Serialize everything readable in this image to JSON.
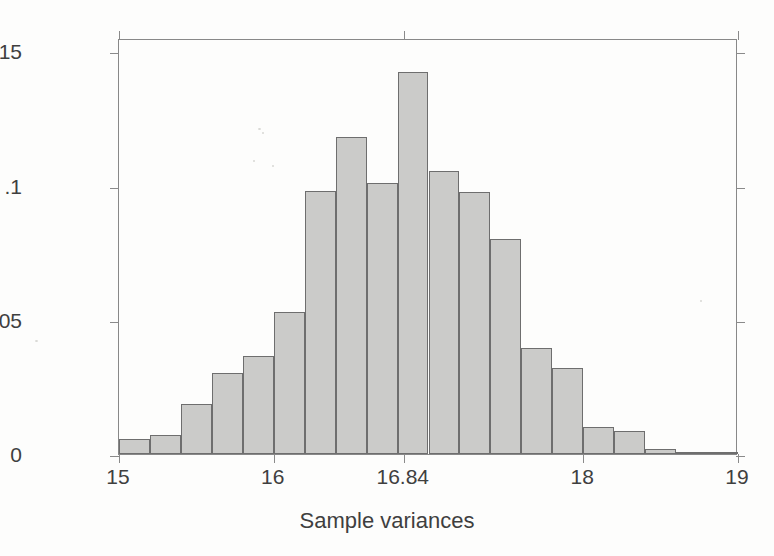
{
  "figure": {
    "background_color": "#fdfdfc",
    "frame_color": "#888888"
  },
  "chart_data": {
    "type": "bar",
    "subtype": "histogram",
    "title": "",
    "xlabel": "Sample variances",
    "ylabel": "Fraction",
    "xlim": [
      15,
      19
    ],
    "ylim": [
      0,
      0.155
    ],
    "grid": false,
    "legend": null,
    "bar_color": "#cbcbc9",
    "bar_border_color": "#6e6e6e",
    "bin_width": 0.2,
    "xticks": [
      {
        "value": 15,
        "label": "15"
      },
      {
        "value": 16,
        "label": "16"
      },
      {
        "value": 16.84,
        "label": "16.84"
      },
      {
        "value": 18,
        "label": "18"
      },
      {
        "value": 19,
        "label": "19"
      }
    ],
    "yticks": [
      {
        "value": 0,
        "label": "0"
      },
      {
        "value": 0.05,
        "label": ".05"
      },
      {
        "value": 0.1,
        "label": ".1"
      },
      {
        "value": 0.15,
        "label": ".15"
      }
    ],
    "bins": [
      {
        "x0": 15.0,
        "x1": 15.2,
        "value": 0.0055
      },
      {
        "x0": 15.2,
        "x1": 15.4,
        "value": 0.007
      },
      {
        "x0": 15.4,
        "x1": 15.6,
        "value": 0.0185
      },
      {
        "x0": 15.6,
        "x1": 15.8,
        "value": 0.03
      },
      {
        "x0": 15.8,
        "x1": 16.0,
        "value": 0.0365
      },
      {
        "x0": 16.0,
        "x1": 16.2,
        "value": 0.053
      },
      {
        "x0": 16.2,
        "x1": 16.4,
        "value": 0.098
      },
      {
        "x0": 16.4,
        "x1": 16.6,
        "value": 0.118
      },
      {
        "x0": 16.6,
        "x1": 16.8,
        "value": 0.101
      },
      {
        "x0": 16.8,
        "x1": 17.0,
        "value": 0.1425
      },
      {
        "x0": 17.0,
        "x1": 17.2,
        "value": 0.1055
      },
      {
        "x0": 17.2,
        "x1": 17.4,
        "value": 0.0975
      },
      {
        "x0": 17.4,
        "x1": 17.6,
        "value": 0.08
      },
      {
        "x0": 17.6,
        "x1": 17.8,
        "value": 0.0395
      },
      {
        "x0": 17.8,
        "x1": 18.0,
        "value": 0.032
      },
      {
        "x0": 18.0,
        "x1": 18.2,
        "value": 0.01
      },
      {
        "x0": 18.2,
        "x1": 18.4,
        "value": 0.0085
      },
      {
        "x0": 18.4,
        "x1": 18.6,
        "value": 0.0018
      },
      {
        "x0": 18.6,
        "x1": 18.8,
        "value": 0.0004
      },
      {
        "x0": 18.8,
        "x1": 19.0,
        "value": 0.0004
      }
    ]
  }
}
